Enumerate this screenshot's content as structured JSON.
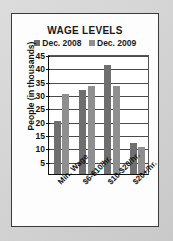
{
  "chart_data": {
    "type": "bar",
    "title": "WAGE LEVELS",
    "xlabel": "",
    "ylabel": "People (in thousands)",
    "categories": [
      "Min. Wage",
      "$6-$10/hr.",
      "$10-$20/hr.",
      "$20+/hr."
    ],
    "series": [
      {
        "name": "Dec. 2008",
        "color": "#6f6f6f",
        "values": [
          20,
          31.5,
          41,
          11.5
        ]
      },
      {
        "name": "Dec. 2009",
        "color": "#8f8f8f",
        "values": [
          30,
          33,
          33,
          10
        ]
      }
    ],
    "ylim": [
      0,
      45
    ],
    "yticks": [
      45,
      40,
      35,
      30,
      25,
      20,
      15,
      10,
      5
    ],
    "grid": true,
    "legend_position": "top"
  }
}
